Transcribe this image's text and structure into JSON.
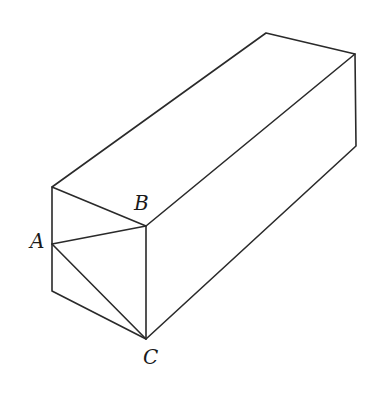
{
  "diagram": {
    "stroke_color": "#2a2a2a",
    "labels": {
      "A": "A",
      "B": "B",
      "C": "C"
    },
    "vertices": {
      "front_top_left": [
        52,
        187
      ],
      "B": [
        146,
        226
      ],
      "A": [
        52,
        244
      ],
      "front_bottom_left": [
        52,
        291
      ],
      "C": [
        146,
        339
      ],
      "back_top_left": [
        266,
        33
      ],
      "back_top_right": [
        355,
        54
      ],
      "back_bottom_right": [
        356,
        146
      ]
    }
  }
}
